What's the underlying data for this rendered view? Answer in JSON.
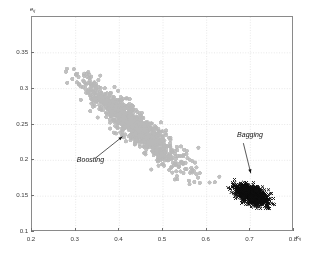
{
  "chart_data": {
    "type": "scatter",
    "title": "",
    "xlabel": "kappa",
    "xlabel_symbol": "κ",
    "xlabel_subscript": "ij",
    "ylabel": "e",
    "ylabel_symbol": "e",
    "ylabel_subscript": "ij",
    "xlim": [
      0.2,
      0.8
    ],
    "ylim": [
      0.1,
      0.4
    ],
    "xticks": [
      0.2,
      0.3,
      0.4,
      0.5,
      0.6,
      0.7,
      0.8
    ],
    "xticklabels": [
      "0.2",
      "0.3",
      "0.4",
      "0.5",
      "0.6",
      "0.7",
      "0.8"
    ],
    "yticks": [
      0.1,
      0.15,
      0.2,
      0.25,
      0.3,
      0.35
    ],
    "yticklabels": [
      "0.1",
      "0.15",
      "0.2",
      "0.25",
      "0.3",
      "0.35"
    ],
    "grid": true,
    "legend_position": "none",
    "series": [
      {
        "name": "Boosting",
        "marker": "circle",
        "color": "#b8b8b8",
        "marker_size": 4.2,
        "n_points": 950,
        "x_mean": 0.435,
        "y_mean": 0.248,
        "x_std": 0.062,
        "y_std": 0.032,
        "correlation": -0.93,
        "x_range": [
          0.275,
          0.665
        ],
        "y_range": [
          0.163,
          0.333
        ],
        "description": "Elongated anti-correlated band running from upper-left to lower-right"
      },
      {
        "name": "Bagging",
        "marker": "x",
        "color": "#0d0d0d",
        "marker_size": 3.0,
        "n_points": 950,
        "x_mean": 0.704,
        "y_mean": 0.152,
        "x_std": 0.018,
        "y_std": 0.0072,
        "correlation": -0.55,
        "x_range": [
          0.645,
          0.762
        ],
        "y_range": [
          0.132,
          0.176
        ],
        "description": "Tight dense cluster at lower right"
      }
    ],
    "annotations": [
      {
        "label": "Boosting",
        "text_x": 0.305,
        "text_y": 0.197,
        "arrow_from_x": 0.345,
        "arrow_from_y": 0.203,
        "arrow_to_x": 0.407,
        "arrow_to_y": 0.233
      },
      {
        "label": "Bagging",
        "text_x": 0.672,
        "text_y": 0.232,
        "arrow_from_x": 0.684,
        "arrow_from_y": 0.224,
        "arrow_to_x": 0.701,
        "arrow_to_y": 0.182
      }
    ]
  }
}
